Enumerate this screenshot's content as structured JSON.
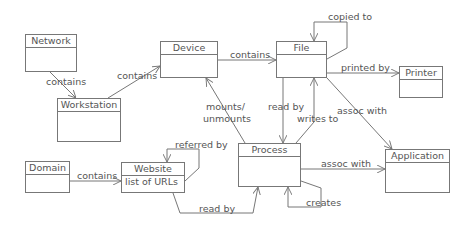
{
  "diagram": {
    "type": "uml-class-relationship",
    "classes": [
      {
        "id": "network",
        "name": "Network",
        "attributes": []
      },
      {
        "id": "workstation",
        "name": "Workstation",
        "attributes": []
      },
      {
        "id": "device",
        "name": "Device",
        "attributes": []
      },
      {
        "id": "file",
        "name": "File",
        "attributes": []
      },
      {
        "id": "printer",
        "name": "Printer",
        "attributes": []
      },
      {
        "id": "domain",
        "name": "Domain",
        "attributes": []
      },
      {
        "id": "website",
        "name": "Website",
        "attributes": [
          "list of URLs"
        ]
      },
      {
        "id": "process",
        "name": "Process",
        "attributes": []
      },
      {
        "id": "application",
        "name": "Application",
        "attributes": []
      }
    ],
    "relations": [
      {
        "from": "Network",
        "to": "Workstation",
        "label": "contains"
      },
      {
        "from": "Workstation",
        "to": "Device",
        "label": "contains"
      },
      {
        "from": "Device",
        "to": "File",
        "label": "contains"
      },
      {
        "from": "File",
        "to": "File",
        "label": "copied to"
      },
      {
        "from": "File",
        "to": "Printer",
        "label": "printed by"
      },
      {
        "from": "File",
        "to": "Process",
        "label": "read by"
      },
      {
        "from": "Process",
        "to": "File",
        "label": "writes to"
      },
      {
        "from": "File",
        "to": "Application",
        "label": "assoc with"
      },
      {
        "from": "Process",
        "to": "Device",
        "label": "mounts/ unmounts"
      },
      {
        "from": "Process",
        "to": "Application",
        "label": "assoc with"
      },
      {
        "from": "Process",
        "to": "Process",
        "label": "creates"
      },
      {
        "from": "Domain",
        "to": "Website",
        "label": "contains"
      },
      {
        "from": "Website",
        "to": "Website",
        "label": "referred by"
      },
      {
        "from": "Website",
        "to": "Process",
        "label": "read by"
      }
    ]
  },
  "labels": {
    "network_workstation": "contains",
    "workstation_device": "contains",
    "device_file": "contains",
    "file_copied": "copied to",
    "file_printer": "printed by",
    "file_process_read": "read by",
    "process_file_write": "writes to",
    "file_application": "assoc with",
    "mounts_1": "mounts/",
    "mounts_2": "unmounts",
    "process_application": "assoc with",
    "process_creates": "creates",
    "domain_website": "contains",
    "website_referred": "referred by",
    "website_process_read": "read by"
  }
}
